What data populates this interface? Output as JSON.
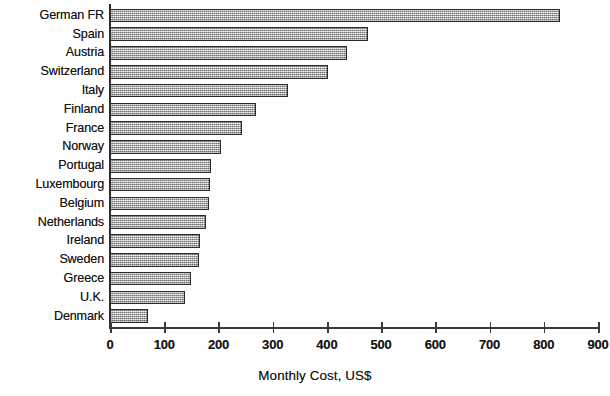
{
  "chart_data": {
    "type": "bar",
    "orientation": "horizontal",
    "title": "",
    "subtitle": "",
    "xlabel": "Monthly Cost, US$",
    "ylabel": "",
    "xlim": [
      0,
      900
    ],
    "xticks": [
      0,
      100,
      200,
      300,
      400,
      500,
      600,
      700,
      800,
      900
    ],
    "xtick_labels": [
      "0",
      "100",
      "200",
      "300",
      "400",
      "500",
      "600",
      "700",
      "800",
      "900"
    ],
    "grid": false,
    "legend": null,
    "legend_position": "none",
    "categories": [
      "German FR",
      "Spain",
      "Austria",
      "Switzerland",
      "Italy",
      "Finland",
      "France",
      "Norway",
      "Portugal",
      "Luxembourg",
      "Belgium",
      "Netherlands",
      "Ireland",
      "Sweden",
      "Greece",
      "U.K.",
      "Denmark"
    ],
    "values": [
      830,
      475,
      438,
      402,
      328,
      270,
      243,
      205,
      186,
      185,
      182,
      177,
      166,
      164,
      150,
      139,
      70
    ],
    "bars": [
      {
        "label": "German FR",
        "value": 830
      },
      {
        "label": "Spain",
        "value": 475
      },
      {
        "label": "Austria",
        "value": 438
      },
      {
        "label": "Switzerland",
        "value": 402
      },
      {
        "label": "Italy",
        "value": 328
      },
      {
        "label": "Finland",
        "value": 270
      },
      {
        "label": "France",
        "value": 243
      },
      {
        "label": "Norway",
        "value": 205
      },
      {
        "label": "Portugal",
        "value": 186
      },
      {
        "label": "Luxembourg",
        "value": 185
      },
      {
        "label": "Belgium",
        "value": 182
      },
      {
        "label": "Netherlands",
        "value": 177
      },
      {
        "label": "Ireland",
        "value": 166
      },
      {
        "label": "Sweden",
        "value": 164
      },
      {
        "label": "Greece",
        "value": 150
      },
      {
        "label": "U.K.",
        "value": 139
      },
      {
        "label": "Denmark",
        "value": 70
      }
    ],
    "colors": {
      "bar_fill": "#b7b7b7",
      "bar_border": "#2b2b2b",
      "axis": "#3a3a3a",
      "text": "#141414",
      "background": "#ffffff"
    }
  }
}
